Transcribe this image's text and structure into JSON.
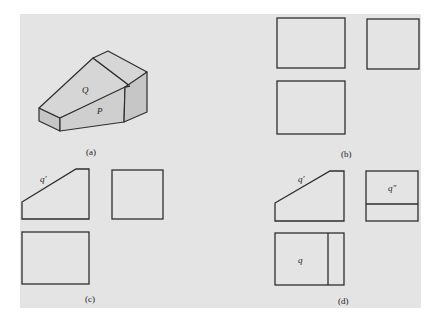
{
  "figure": {
    "background_color": "#e4e4e4",
    "line_color": "#2e2e2e",
    "panels": [
      {
        "id": "a",
        "caption": "(a)",
        "description": "Isometric view of a wedge-shaped block with inclined face",
        "face_labels": [
          "Q",
          "P"
        ]
      },
      {
        "id": "b",
        "caption": "(b)",
        "description": "Three-view outline boxes (front, side, top) — blank",
        "face_labels": []
      },
      {
        "id": "c",
        "caption": "(c)",
        "description": "Front view with inclined edge labeled q′, side view and top view as plain rectangles",
        "face_labels": [
          "q′"
        ]
      },
      {
        "id": "d",
        "caption": "(d)",
        "description": "Complete three views with projections of plane Q labeled",
        "face_labels": [
          "q′",
          "q″",
          "q"
        ]
      }
    ]
  }
}
